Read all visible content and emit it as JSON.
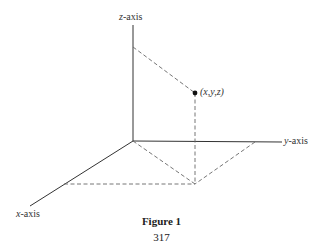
{
  "diagram": {
    "type": "3d-coordinate-axes",
    "axes": {
      "z": {
        "label_var": "z",
        "label_suffix": "-axis"
      },
      "y": {
        "label_var": "y",
        "label_suffix": "-axis"
      },
      "x": {
        "label_var": "x",
        "label_suffix": "-axis"
      }
    },
    "point_label": "(x,y,z)",
    "line_color": "#333333",
    "dash_color": "#555555"
  },
  "caption": {
    "title": "Figure 1",
    "page_number": "317"
  }
}
